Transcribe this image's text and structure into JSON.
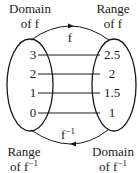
{
  "labels": {
    "domain_f_line1": "Domain",
    "domain_f_line2": "of f",
    "range_f_line1": "Range",
    "range_f_line2": "of f",
    "range_finv_line1": "Range",
    "range_finv_line2": "of f",
    "domain_finv_line1": "Domain",
    "domain_finv_line2": "of f",
    "inverse_sup": "−1",
    "top_arrow": "f",
    "bottom_arrow": "f",
    "bottom_arrow_sup": "−1"
  },
  "mapping": {
    "left_values": [
      "3",
      "2",
      "1",
      "0"
    ],
    "right_values": [
      "2.5",
      "2",
      "1.5",
      "1"
    ]
  },
  "colors": {
    "stroke": "#1a1a1a",
    "background": "#ffffff"
  }
}
